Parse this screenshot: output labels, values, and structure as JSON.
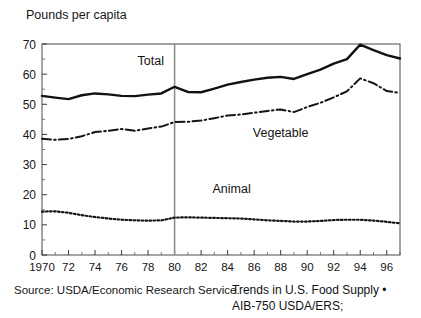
{
  "chart_data": {
    "type": "line",
    "title": "",
    "ylabel": "Pounds per capita",
    "xlabel": "",
    "ylim": [
      0,
      70
    ],
    "xlim": [
      1970,
      1997
    ],
    "yticks": [
      0,
      10,
      20,
      30,
      40,
      50,
      60,
      70
    ],
    "xticks": [
      1970,
      1972,
      1974,
      1976,
      1978,
      1980,
      1982,
      1984,
      1986,
      1988,
      1990,
      1992,
      1994,
      1996
    ],
    "xticklabels": [
      "1970",
      "72",
      "74",
      "76",
      "78",
      "80",
      "82",
      "84",
      "86",
      "88",
      "90",
      "92",
      "94",
      "96"
    ],
    "grid": false,
    "legend_position": "inline-annotations",
    "x": [
      1970,
      1971,
      1972,
      1973,
      1974,
      1975,
      1976,
      1977,
      1978,
      1979,
      1980,
      1981,
      1982,
      1983,
      1984,
      1985,
      1986,
      1987,
      1988,
      1989,
      1990,
      1991,
      1992,
      1993,
      1994,
      1995,
      1996,
      1997
    ],
    "series": [
      {
        "name": "Total",
        "style": "solid",
        "color": "#121212",
        "values": [
          52.8,
          52.2,
          51.7,
          53.0,
          53.6,
          53.3,
          52.8,
          52.7,
          53.2,
          53.6,
          55.8,
          54.1,
          54.0,
          55.2,
          56.5,
          57.4,
          58.2,
          58.8,
          59.1,
          58.4,
          60.0,
          61.5,
          63.5,
          65.0,
          69.8,
          68.0,
          66.3,
          65.2
        ]
      },
      {
        "name": "Vegetable",
        "style": "dash-dot",
        "color": "#141414",
        "values": [
          38.6,
          38.2,
          38.5,
          39.4,
          40.8,
          41.2,
          41.8,
          41.2,
          42.0,
          42.6,
          44.1,
          44.2,
          44.6,
          45.4,
          46.3,
          46.6,
          47.2,
          47.8,
          48.3,
          47.4,
          49.1,
          50.5,
          52.3,
          54.3,
          58.6,
          57.0,
          54.4,
          53.8
        ]
      },
      {
        "name": "Animal",
        "style": "dotted",
        "color": "#161616",
        "values": [
          14.4,
          14.5,
          14.0,
          13.2,
          12.6,
          12.1,
          11.7,
          11.5,
          11.4,
          11.5,
          12.4,
          12.5,
          12.4,
          12.3,
          12.2,
          12.1,
          11.8,
          11.5,
          11.3,
          11.1,
          11.1,
          11.3,
          11.6,
          11.7,
          11.7,
          11.4,
          11.0,
          10.5
        ]
      }
    ],
    "annotations": [
      {
        "text": "Total",
        "x": 1978.2,
        "y": 63.0
      },
      {
        "text": "Vegetable",
        "x": 1988.0,
        "y": 39.0
      },
      {
        "text": "Animal",
        "x": 1984.3,
        "y": 20.5
      }
    ],
    "reference_line": {
      "x": 1980,
      "color": "#8e8e8e",
      "orientation": "vertical"
    }
  },
  "source": {
    "left": "Source:  USDA/Economic Research Service.",
    "right_line1": "Trends in U.S. Food Supply •",
    "right_line2": "AIB-750 USDA/ERS;"
  }
}
